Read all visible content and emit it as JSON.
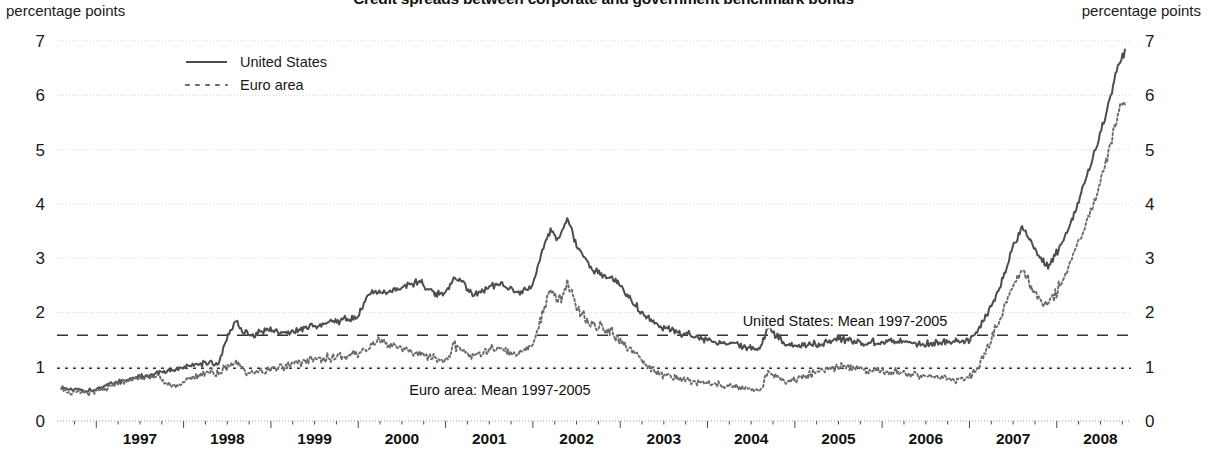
{
  "title": "Credit spreads between corporate and government benchmark bonds",
  "axis_unit_left": "percentage points",
  "axis_unit_right": "percentage points",
  "legend": [
    {
      "label": "United States",
      "style": "solid",
      "color": "#4d4d4d"
    },
    {
      "label": "Euro area",
      "style": "dotted",
      "color": "#6b6b6b"
    }
  ],
  "annotations": [
    {
      "text": "United States: Mean 1997-2005",
      "value": 1.58
    },
    {
      "text": "Euro area: Mean 1997-2005",
      "value": 0.97
    }
  ],
  "chart_data": {
    "type": "line",
    "title": "Credit spreads between corporate and government benchmark bonds",
    "xlabel": "",
    "ylabel": "percentage points",
    "ylim": [
      0,
      7
    ],
    "yticks": [
      0,
      1,
      2,
      3,
      4,
      5,
      6,
      7
    ],
    "ytick_labels": [
      "0",
      "1",
      "2",
      "3",
      "4",
      "5",
      "6",
      "7"
    ],
    "xlim": [
      1996.55,
      2008.85
    ],
    "xticks": [
      1997,
      1998,
      1999,
      2000,
      2001,
      2002,
      2003,
      2004,
      2005,
      2006,
      2007,
      2008
    ],
    "xtick_labels": [
      "1997",
      "1998",
      "1999",
      "2000",
      "2001",
      "2002",
      "2003",
      "2004",
      "2005",
      "2006",
      "2007",
      "2008"
    ],
    "grid": true,
    "grid_axis": "y",
    "legend_position": "top-left",
    "dual_y_axis": true,
    "reference_lines": [
      {
        "name": "United States: Mean 1997-2005",
        "value": 1.58,
        "style": "dashed"
      },
      {
        "name": "Euro area: Mean 1997-2005",
        "value": 0.97,
        "style": "dotted"
      }
    ],
    "series": [
      {
        "name": "United States",
        "style": "solid",
        "color": "#4d4d4d",
        "x": [
          1996.6,
          1996.7,
          1996.8,
          1996.9,
          1997.0,
          1997.1,
          1997.2,
          1997.3,
          1997.4,
          1997.5,
          1997.6,
          1997.7,
          1997.8,
          1997.9,
          1998.0,
          1998.1,
          1998.2,
          1998.3,
          1998.4,
          1998.5,
          1998.6,
          1998.7,
          1998.8,
          1998.9,
          1999.0,
          1999.1,
          1999.2,
          1999.3,
          1999.4,
          1999.5,
          1999.6,
          1999.7,
          1999.8,
          1999.9,
          2000.0,
          2000.1,
          2000.2,
          2000.3,
          2000.4,
          2000.5,
          2000.6,
          2000.7,
          2000.8,
          2000.9,
          2001.0,
          2001.1,
          2001.2,
          2001.3,
          2001.4,
          2001.5,
          2001.6,
          2001.7,
          2001.8,
          2001.9,
          2002.0,
          2002.1,
          2002.2,
          2002.3,
          2002.4,
          2002.5,
          2002.6,
          2002.7,
          2002.8,
          2002.9,
          2003.0,
          2003.1,
          2003.2,
          2003.3,
          2003.4,
          2003.5,
          2003.6,
          2003.7,
          2003.8,
          2003.9,
          2004.0,
          2004.1,
          2004.2,
          2004.3,
          2004.4,
          2004.5,
          2004.6,
          2004.7,
          2004.8,
          2004.9,
          2005.0,
          2005.1,
          2005.2,
          2005.3,
          2005.4,
          2005.5,
          2005.6,
          2005.7,
          2005.8,
          2005.9,
          2006.0,
          2006.1,
          2006.2,
          2006.3,
          2006.4,
          2006.5,
          2006.6,
          2006.7,
          2006.8,
          2006.9,
          2007.0,
          2007.1,
          2007.2,
          2007.3,
          2007.4,
          2007.5,
          2007.6,
          2007.7,
          2007.8,
          2007.9,
          2008.0,
          2008.1,
          2008.2,
          2008.3,
          2008.4,
          2008.5,
          2008.6,
          2008.7,
          2008.78
        ],
        "y": [
          0.62,
          0.58,
          0.6,
          0.55,
          0.6,
          0.64,
          0.7,
          0.74,
          0.78,
          0.82,
          0.84,
          0.88,
          0.92,
          0.95,
          0.98,
          1.02,
          1.05,
          1.08,
          1.06,
          1.55,
          1.85,
          1.62,
          1.58,
          1.66,
          1.7,
          1.64,
          1.62,
          1.66,
          1.7,
          1.76,
          1.8,
          1.82,
          1.86,
          1.88,
          1.92,
          2.3,
          2.38,
          2.34,
          2.42,
          2.48,
          2.52,
          2.56,
          2.44,
          2.36,
          2.34,
          2.6,
          2.56,
          2.34,
          2.38,
          2.46,
          2.5,
          2.46,
          2.38,
          2.42,
          2.5,
          3.1,
          3.5,
          3.36,
          3.75,
          3.2,
          3.0,
          2.76,
          2.7,
          2.62,
          2.5,
          2.3,
          2.1,
          1.94,
          1.8,
          1.72,
          1.68,
          1.62,
          1.58,
          1.54,
          1.5,
          1.46,
          1.44,
          1.4,
          1.38,
          1.36,
          1.32,
          1.72,
          1.55,
          1.4,
          1.38,
          1.4,
          1.42,
          1.44,
          1.46,
          1.52,
          1.5,
          1.46,
          1.44,
          1.46,
          1.46,
          1.48,
          1.48,
          1.46,
          1.44,
          1.42,
          1.44,
          1.46,
          1.48,
          1.46,
          1.5,
          1.7,
          1.95,
          2.3,
          2.7,
          3.2,
          3.58,
          3.3,
          3.0,
          2.86,
          3.1,
          3.4,
          3.8,
          4.3,
          4.8,
          5.3,
          5.9,
          6.55,
          6.8
        ]
      },
      {
        "name": "Euro area",
        "style": "dotted",
        "color": "#6b6b6b",
        "x": [
          1996.6,
          1996.7,
          1996.8,
          1996.9,
          1997.0,
          1997.1,
          1997.2,
          1997.3,
          1997.4,
          1997.5,
          1997.6,
          1997.7,
          1997.8,
          1997.9,
          1998.0,
          1998.1,
          1998.2,
          1998.3,
          1998.4,
          1998.5,
          1998.6,
          1998.7,
          1998.8,
          1998.9,
          1999.0,
          1999.1,
          1999.2,
          1999.3,
          1999.4,
          1999.5,
          1999.6,
          1999.7,
          1999.8,
          1999.9,
          2000.0,
          2000.1,
          2000.2,
          2000.3,
          2000.4,
          2000.5,
          2000.6,
          2000.7,
          2000.8,
          2000.9,
          2001.0,
          2001.1,
          2001.2,
          2001.3,
          2001.4,
          2001.5,
          2001.6,
          2001.7,
          2001.8,
          2001.9,
          2002.0,
          2002.1,
          2002.2,
          2002.3,
          2002.4,
          2002.5,
          2002.6,
          2002.7,
          2002.8,
          2002.9,
          2003.0,
          2003.1,
          2003.2,
          2003.3,
          2003.4,
          2003.5,
          2003.6,
          2003.7,
          2003.8,
          2003.9,
          2004.0,
          2004.1,
          2004.2,
          2004.3,
          2004.4,
          2004.5,
          2004.6,
          2004.7,
          2004.8,
          2004.9,
          2005.0,
          2005.1,
          2005.2,
          2005.3,
          2005.4,
          2005.5,
          2005.6,
          2005.7,
          2005.8,
          2005.9,
          2006.0,
          2006.1,
          2006.2,
          2006.3,
          2006.4,
          2006.5,
          2006.6,
          2006.7,
          2006.8,
          2006.9,
          2007.0,
          2007.1,
          2007.2,
          2007.3,
          2007.4,
          2007.5,
          2007.6,
          2007.7,
          2007.8,
          2007.9,
          2008.0,
          2008.1,
          2008.2,
          2008.3,
          2008.4,
          2008.5,
          2008.6,
          2008.7,
          2008.78
        ],
        "y": [
          0.58,
          0.54,
          0.56,
          0.52,
          0.56,
          0.6,
          0.66,
          0.7,
          0.74,
          0.78,
          0.8,
          0.84,
          0.7,
          0.64,
          0.7,
          0.8,
          0.88,
          0.92,
          0.9,
          1.0,
          1.1,
          0.92,
          0.86,
          0.9,
          0.94,
          0.98,
          1.02,
          1.06,
          1.1,
          1.14,
          1.16,
          1.18,
          1.2,
          1.22,
          1.26,
          1.3,
          1.5,
          1.44,
          1.38,
          1.34,
          1.3,
          1.26,
          1.2,
          1.14,
          1.1,
          1.4,
          1.34,
          1.2,
          1.24,
          1.3,
          1.34,
          1.3,
          1.24,
          1.3,
          1.4,
          1.9,
          2.4,
          2.2,
          2.52,
          2.1,
          1.9,
          1.76,
          1.7,
          1.64,
          1.5,
          1.34,
          1.18,
          1.04,
          0.92,
          0.84,
          0.8,
          0.76,
          0.74,
          0.72,
          0.7,
          0.68,
          0.66,
          0.64,
          0.62,
          0.6,
          0.58,
          0.92,
          0.8,
          0.7,
          0.76,
          0.82,
          0.88,
          0.92,
          0.96,
          1.0,
          0.98,
          0.94,
          0.92,
          0.94,
          0.94,
          0.92,
          0.9,
          0.88,
          0.86,
          0.84,
          0.82,
          0.8,
          0.78,
          0.76,
          0.8,
          1.0,
          1.3,
          1.7,
          2.1,
          2.5,
          2.8,
          2.5,
          2.2,
          2.15,
          2.4,
          2.7,
          3.1,
          3.5,
          3.9,
          4.4,
          5.0,
          5.7,
          5.9
        ]
      }
    ]
  }
}
